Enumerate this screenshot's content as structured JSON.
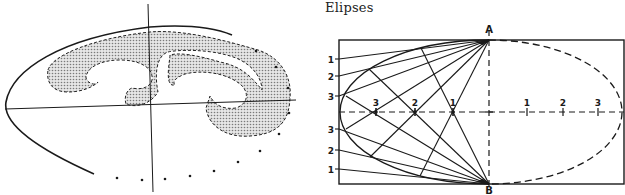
{
  "title": "Elipses",
  "colors": {
    "ink": "#1a1a1a",
    "shade": "#bdbdbd",
    "paper": "#ffffff"
  },
  "left_figure": {
    "description": "French curve template laid over an ellipse with axes",
    "center": [
      150,
      105
    ],
    "vertical_axis": [
      [
        148,
        4
      ],
      [
        153,
        192
      ]
    ],
    "horizontal_axis": [
      [
        5,
        109
      ],
      [
        296,
        100
      ]
    ],
    "outer_curve_path": "M94,174 C40,150 2,125 6,102 C12,70 60,38 150,27 C190,24 215,28 232,35",
    "dots": [
      [
        117,
        178
      ],
      [
        142,
        180
      ],
      [
        165,
        179
      ],
      [
        190,
        176
      ],
      [
        214,
        171
      ],
      [
        238,
        162
      ],
      [
        260,
        151
      ],
      [
        279,
        134
      ],
      [
        289,
        113
      ],
      [
        288,
        88
      ],
      [
        276,
        67
      ],
      [
        256,
        51
      ]
    ]
  },
  "right_figure": {
    "rect": {
      "x": 339,
      "y": 40,
      "w": 285,
      "h": 144
    },
    "center": [
      489,
      112
    ],
    "rx_left": 149,
    "rx_right": 133,
    "ry": 72,
    "point_A": {
      "label": "A",
      "x": 489,
      "y": 40,
      "label_y": 33
    },
    "point_B": {
      "label": "B",
      "x": 489,
      "y": 184,
      "label_y": 194
    },
    "left_labels": [
      {
        "text": "1",
        "y": 59
      },
      {
        "text": "2",
        "y": 76
      },
      {
        "text": "3",
        "y": 96
      },
      {
        "text": "3",
        "y": 129
      },
      {
        "text": "2",
        "y": 150
      },
      {
        "text": "1",
        "y": 169
      }
    ],
    "axis_left_points": [
      {
        "text": "3",
        "x": 376
      },
      {
        "text": "2",
        "x": 415
      },
      {
        "text": "1",
        "x": 453
      }
    ],
    "axis_right_ticks": [
      {
        "text": "1",
        "x": 527
      },
      {
        "text": "2",
        "x": 563
      },
      {
        "text": "3",
        "x": 598
      }
    ],
    "ellipse_points": [
      [
        421,
        48
      ],
      [
        369,
        69
      ],
      [
        346,
        96
      ],
      [
        346,
        129
      ],
      [
        370,
        157
      ],
      [
        420,
        176
      ]
    ]
  }
}
